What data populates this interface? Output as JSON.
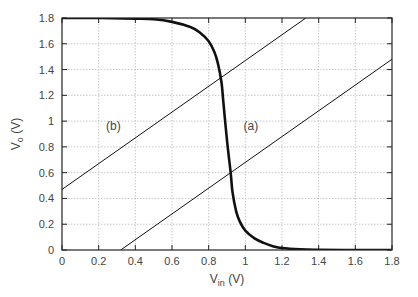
{
  "chart_data": {
    "type": "line",
    "title": "",
    "xlabel": "V_in (V)",
    "ylabel": "V_o (V)",
    "xlim": [
      0,
      1.8
    ],
    "ylim": [
      0,
      1.8
    ],
    "grid": true,
    "xticks": [
      "0",
      "0.2",
      "0.4",
      "0.6",
      "0.8",
      "1",
      "1.2",
      "1.4",
      "1.6",
      "1.8"
    ],
    "yticks": [
      "0",
      "0.2",
      "0.4",
      "0.6",
      "0.8",
      "1",
      "1.2",
      "1.4",
      "1.6",
      "1.8"
    ],
    "series": [
      {
        "name": "VTC",
        "style": "thick",
        "x": [
          0,
          0.2,
          0.4,
          0.5,
          0.6,
          0.7,
          0.75,
          0.8,
          0.83,
          0.85,
          0.87,
          0.88,
          0.9,
          0.92,
          0.93,
          0.95,
          0.97,
          1.0,
          1.05,
          1.1,
          1.15,
          1.2,
          1.3,
          1.4,
          1.6,
          1.8
        ],
        "y": [
          1.8,
          1.8,
          1.795,
          1.79,
          1.77,
          1.73,
          1.69,
          1.62,
          1.54,
          1.45,
          1.3,
          1.15,
          0.85,
          0.6,
          0.45,
          0.3,
          0.22,
          0.15,
          0.09,
          0.055,
          0.03,
          0.015,
          0.005,
          0.002,
          0,
          0
        ]
      },
      {
        "name": "(a)",
        "style": "thin",
        "x": [
          0.32,
          1.8
        ],
        "y": [
          0,
          1.48
        ]
      },
      {
        "name": "(b)",
        "style": "thin",
        "x": [
          0,
          1.33
        ],
        "y": [
          0.47,
          1.8
        ]
      }
    ],
    "annotations": [
      {
        "text": "(a)",
        "x": 1.03,
        "y": 0.93
      },
      {
        "text": "(b)",
        "x": 0.28,
        "y": 0.93
      }
    ]
  },
  "labels": {
    "xlabel_main": "V",
    "xlabel_sub": "in",
    "xlabel_unit": " (V)",
    "ylabel_main": "V",
    "ylabel_sub": "o",
    "ylabel_unit": " (V)"
  }
}
